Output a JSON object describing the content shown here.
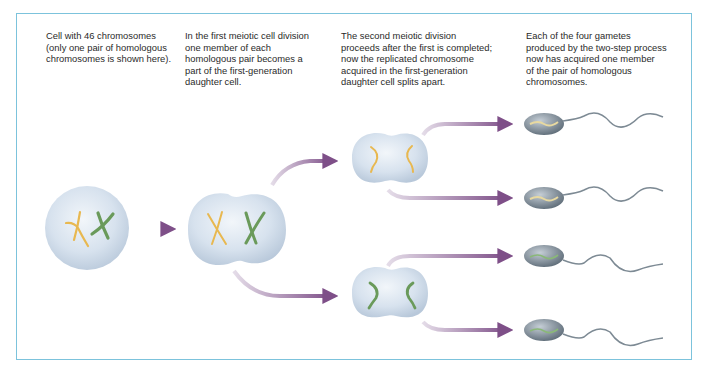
{
  "diagram": {
    "type": "meiosis-process",
    "captions": [
      {
        "id": "stage-1",
        "text": "Cell with 46 chromosomes\n(only  one pair of homologous\nchromosomes is shown here)."
      },
      {
        "id": "stage-2",
        "text": "In the first meiotic cell division\none member of each\nhomologous pair becomes a\npart of the first-generation\ndaughter cell."
      },
      {
        "id": "stage-3",
        "text": "The second meiotic division\nproceeds after the first is completed;\nnow the replicated chromosome\nacquired in the first-generation\ndaughter cell splits apart."
      },
      {
        "id": "stage-4",
        "text": "Each of  the four gametes\nproduced by the two-step process\nnow has acquired one member\nof the pair of homologous\nchromosomes."
      }
    ],
    "colors": {
      "frame": "#7cc3dc",
      "cell": "#d6e2ee",
      "chromosome_a": "#e8b850",
      "chromosome_b": "#6a9a5a",
      "arrow": "#8a5a8e",
      "sperm": "#7d8a94"
    },
    "nodes": [
      {
        "id": "parent-cell",
        "label": "Cell with 46 chromosomes"
      },
      {
        "id": "first-generation-cell"
      },
      {
        "id": "second-division-cell-top",
        "chromosome": "yellow"
      },
      {
        "id": "second-division-cell-bottom",
        "chromosome": "green"
      },
      {
        "id": "gamete-1",
        "chromosome": "yellow"
      },
      {
        "id": "gamete-2",
        "chromosome": "yellow"
      },
      {
        "id": "gamete-3",
        "chromosome": "green"
      },
      {
        "id": "gamete-4",
        "chromosome": "green"
      }
    ]
  }
}
